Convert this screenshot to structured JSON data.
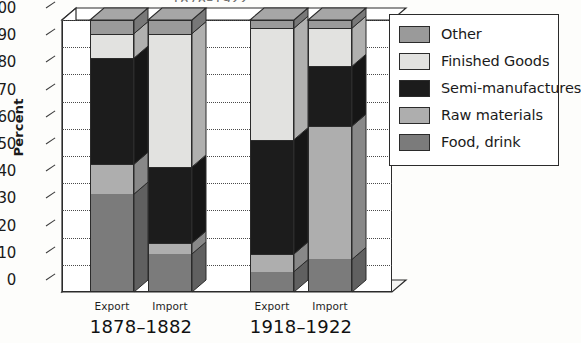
{
  "chart_data": {
    "type": "bar",
    "subtype": "stacked-column-3d",
    "title": "1878–1922",
    "title_clipped": true,
    "xlabel": "",
    "ylabel": "Percent",
    "ylim": [
      0,
      100
    ],
    "yticks": [
      0,
      10,
      20,
      30,
      40,
      50,
      60,
      70,
      80,
      90,
      100
    ],
    "grid": "horizontal-dotted",
    "legend_position": "right",
    "groups": [
      "1878–1882",
      "1918–1922"
    ],
    "categories": [
      "Export",
      "Import",
      "Export",
      "Import"
    ],
    "bars": [
      {
        "group": "1878–1882",
        "category": "Export"
      },
      {
        "group": "1878–1882",
        "category": "Import"
      },
      {
        "group": "1918–1922",
        "category": "Export"
      },
      {
        "group": "1918–1922",
        "category": "Import"
      }
    ],
    "series": [
      {
        "name": "Food, drink",
        "color": "#7b7b7b",
        "values": [
          36,
          14,
          7.5,
          12
        ]
      },
      {
        "name": "Raw materials",
        "color": "#aeaeae",
        "values": [
          11,
          4,
          6.5,
          49
        ]
      },
      {
        "name": "Semi-manufactures",
        "color": "#1c1c1c",
        "values": [
          39,
          28,
          42,
          22
        ]
      },
      {
        "name": "Finished Goods",
        "color": "#e2e2e0",
        "values": [
          9,
          49,
          41,
          14
        ]
      },
      {
        "name": "Other",
        "color": "#9a9a9a",
        "values": [
          5,
          5,
          3,
          3
        ]
      }
    ],
    "stack_order_bottom_to_top": [
      "Food, drink",
      "Raw materials",
      "Semi-manufactures",
      "Finished Goods",
      "Other"
    ]
  },
  "legend": {
    "items": [
      {
        "label": "Other",
        "color": "#9a9a9a"
      },
      {
        "label": "Finished Goods",
        "color": "#e2e2e0"
      },
      {
        "label": "Semi-manufactures",
        "color": "#1c1c1c"
      },
      {
        "label": "Raw materials",
        "color": "#aeaeae"
      },
      {
        "label": "Food, drink",
        "color": "#7b7b7b"
      }
    ]
  },
  "axis": {
    "y_title": "Percent",
    "y_ticks": [
      "100",
      "90",
      "80",
      "70",
      "60",
      "50",
      "40",
      "30",
      "20",
      "10",
      "0"
    ]
  },
  "x_axis": {
    "bar_labels": [
      "Export",
      "Import",
      "Export",
      "Import"
    ],
    "group_labels": [
      "1878–1882",
      "1918–1922"
    ]
  }
}
